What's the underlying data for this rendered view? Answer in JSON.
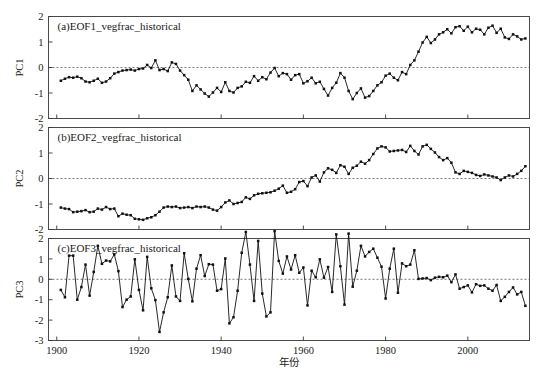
{
  "figure": {
    "background": "#ffffff",
    "line_color": "#111111",
    "frame_color": "#4a4a4a",
    "zero_line_color": "#555555",
    "xlabel": "年份",
    "x_ticks": [
      1900,
      1920,
      1940,
      1960,
      1980,
      2000
    ],
    "x_range": [
      1898,
      2015
    ]
  },
  "chart_data": [
    {
      "type": "line",
      "title": "(a)EOF1_vegfrac_historical",
      "ylabel": "PC1",
      "xlabel": "",
      "ylim": [
        -2,
        2
      ],
      "y_ticks": [
        -2,
        -1,
        0,
        1,
        2
      ],
      "grid": false,
      "legend": "none",
      "zero_reference": 0,
      "x": [
        1901,
        1902,
        1903,
        1904,
        1905,
        1906,
        1907,
        1908,
        1909,
        1910,
        1911,
        1912,
        1913,
        1914,
        1915,
        1916,
        1917,
        1918,
        1919,
        1920,
        1921,
        1922,
        1923,
        1924,
        1925,
        1926,
        1927,
        1928,
        1929,
        1930,
        1931,
        1932,
        1933,
        1934,
        1935,
        1936,
        1937,
        1938,
        1939,
        1940,
        1941,
        1942,
        1943,
        1944,
        1945,
        1946,
        1947,
        1948,
        1949,
        1950,
        1951,
        1952,
        1953,
        1954,
        1955,
        1956,
        1957,
        1958,
        1959,
        1960,
        1961,
        1962,
        1963,
        1964,
        1965,
        1966,
        1967,
        1968,
        1969,
        1970,
        1971,
        1972,
        1973,
        1974,
        1975,
        1976,
        1977,
        1978,
        1979,
        1980,
        1981,
        1982,
        1983,
        1984,
        1985,
        1986,
        1987,
        1988,
        1989,
        1990,
        1991,
        1992,
        1993,
        1994,
        1995,
        1996,
        1997,
        1998,
        1999,
        2000,
        2001,
        2002,
        2003,
        2004,
        2005,
        2006,
        2007,
        2008,
        2009,
        2010,
        2011,
        2012,
        2013,
        2014
      ],
      "values": [
        -0.52,
        -0.44,
        -0.38,
        -0.4,
        -0.36,
        -0.42,
        -0.55,
        -0.58,
        -0.52,
        -0.44,
        -0.6,
        -0.55,
        -0.42,
        -0.24,
        -0.18,
        -0.12,
        -0.1,
        -0.08,
        -0.12,
        -0.06,
        -0.04,
        0.1,
        -0.02,
        0.28,
        -0.1,
        -0.06,
        -0.14,
        0.2,
        0.14,
        -0.12,
        -0.3,
        -0.48,
        -0.92,
        -0.7,
        -0.86,
        -1.02,
        -1.14,
        -0.98,
        -0.8,
        -0.96,
        -0.58,
        -0.92,
        -0.98,
        -0.8,
        -0.74,
        -0.56,
        -0.6,
        -0.34,
        -0.52,
        -0.38,
        -0.46,
        -0.2,
        -0.02,
        -0.34,
        -0.22,
        -0.26,
        -0.48,
        -0.3,
        -0.26,
        -0.62,
        -0.54,
        -0.4,
        -0.62,
        -0.56,
        -0.84,
        -1.1,
        -0.8,
        -0.6,
        -0.22,
        -0.4,
        -0.92,
        -1.24,
        -1.0,
        -0.82,
        -1.18,
        -1.12,
        -0.92,
        -0.7,
        -0.58,
        -0.32,
        -0.24,
        -0.4,
        -0.5,
        -0.18,
        -0.26,
        0.1,
        0.28,
        0.62,
        0.98,
        1.2,
        0.96,
        1.1,
        1.3,
        1.38,
        1.5,
        1.34,
        1.58,
        1.62,
        1.44,
        1.6,
        1.38,
        1.52,
        1.48,
        1.3,
        1.56,
        1.64,
        1.36,
        1.52,
        1.18,
        1.12,
        1.3,
        1.22,
        1.1,
        1.14
      ]
    },
    {
      "type": "line",
      "title": "(b)EOF2_vegfrac_historical",
      "ylabel": "PC2",
      "xlabel": "",
      "ylim": [
        -2,
        2
      ],
      "y_ticks": [
        -2,
        -1,
        0,
        1,
        2
      ],
      "grid": false,
      "legend": "none",
      "zero_reference": 0,
      "x": [
        1901,
        1902,
        1903,
        1904,
        1905,
        1906,
        1907,
        1908,
        1909,
        1910,
        1911,
        1912,
        1913,
        1914,
        1915,
        1916,
        1917,
        1918,
        1919,
        1920,
        1921,
        1922,
        1923,
        1924,
        1925,
        1926,
        1927,
        1928,
        1929,
        1930,
        1931,
        1932,
        1933,
        1934,
        1935,
        1936,
        1937,
        1938,
        1939,
        1940,
        1941,
        1942,
        1943,
        1944,
        1945,
        1946,
        1947,
        1948,
        1949,
        1950,
        1951,
        1952,
        1953,
        1954,
        1955,
        1956,
        1957,
        1958,
        1959,
        1960,
        1961,
        1962,
        1963,
        1964,
        1965,
        1966,
        1967,
        1968,
        1969,
        1970,
        1971,
        1972,
        1973,
        1974,
        1975,
        1976,
        1977,
        1978,
        1979,
        1980,
        1981,
        1982,
        1983,
        1984,
        1985,
        1986,
        1987,
        1988,
        1989,
        1990,
        1991,
        1992,
        1993,
        1994,
        1995,
        1996,
        1997,
        1998,
        1999,
        2000,
        2001,
        2002,
        2003,
        2004,
        2005,
        2006,
        2007,
        2008,
        2009,
        2010,
        2011,
        2012,
        2013,
        2014
      ],
      "values": [
        -1.14,
        -1.18,
        -1.2,
        -1.32,
        -1.3,
        -1.28,
        -1.24,
        -1.32,
        -1.3,
        -1.18,
        -1.22,
        -1.12,
        -1.2,
        -1.18,
        -1.48,
        -1.38,
        -1.42,
        -1.44,
        -1.58,
        -1.6,
        -1.62,
        -1.56,
        -1.52,
        -1.44,
        -1.3,
        -1.14,
        -1.1,
        -1.12,
        -1.1,
        -1.16,
        -1.14,
        -1.12,
        -1.16,
        -1.1,
        -1.12,
        -1.1,
        -1.14,
        -1.22,
        -1.26,
        -1.12,
        -0.94,
        -0.86,
        -1.0,
        -0.96,
        -0.92,
        -0.74,
        -0.8,
        -0.66,
        -0.6,
        -0.58,
        -0.56,
        -0.54,
        -0.48,
        -0.4,
        -0.28,
        -0.56,
        -0.52,
        -0.42,
        -0.14,
        -0.1,
        -0.3,
        0.04,
        0.12,
        -0.12,
        0.24,
        0.4,
        0.34,
        0.22,
        0.52,
        0.46,
        0.18,
        0.42,
        0.5,
        0.66,
        0.58,
        0.72,
        0.96,
        1.18,
        1.26,
        1.22,
        1.06,
        1.08,
        1.1,
        1.12,
        1.04,
        1.28,
        1.08,
        0.94,
        1.26,
        1.32,
        1.16,
        1.02,
        0.84,
        0.72,
        0.8,
        0.62,
        0.24,
        0.18,
        0.3,
        0.26,
        0.22,
        0.14,
        0.1,
        0.16,
        0.12,
        0.08,
        0.04,
        -0.06,
        0.04,
        0.12,
        0.08,
        0.18,
        0.3,
        0.48,
        0.34,
        0.26,
        0.36,
        0.4,
        0.52
      ]
    },
    {
      "type": "line",
      "title": "(c)EOF3_vegfrac_historical",
      "ylabel": "PC3",
      "xlabel": "年份",
      "ylim": [
        -3,
        2
      ],
      "y_ticks": [
        -3,
        -2,
        -1,
        0,
        1,
        2
      ],
      "grid": false,
      "legend": "none",
      "zero_reference": 0,
      "x": [
        1901,
        1902,
        1903,
        1904,
        1905,
        1906,
        1907,
        1908,
        1909,
        1910,
        1911,
        1912,
        1913,
        1914,
        1915,
        1916,
        1917,
        1918,
        1919,
        1920,
        1921,
        1922,
        1923,
        1924,
        1925,
        1926,
        1927,
        1928,
        1929,
        1930,
        1931,
        1932,
        1933,
        1934,
        1935,
        1936,
        1937,
        1938,
        1939,
        1940,
        1941,
        1942,
        1943,
        1944,
        1945,
        1946,
        1947,
        1948,
        1949,
        1950,
        1951,
        1952,
        1953,
        1954,
        1955,
        1956,
        1957,
        1958,
        1959,
        1960,
        1961,
        1962,
        1963,
        1964,
        1965,
        1966,
        1967,
        1968,
        1969,
        1970,
        1971,
        1972,
        1973,
        1974,
        1975,
        1976,
        1977,
        1978,
        1979,
        1980,
        1981,
        1982,
        1983,
        1984,
        1985,
        1986,
        1987,
        1988,
        1989,
        1990,
        1991,
        1992,
        1993,
        1994,
        1995,
        1996,
        1997,
        1998,
        1999,
        2000,
        2001,
        2002,
        2003,
        2004,
        2005,
        2006,
        2007,
        2008,
        2009,
        2010,
        2011,
        2012,
        2013,
        2014
      ],
      "values": [
        -0.52,
        -0.88,
        1.16,
        1.16,
        -1.0,
        -0.38,
        0.72,
        -0.8,
        0.36,
        1.64,
        0.76,
        0.92,
        0.88,
        1.22,
        0.4,
        -1.36,
        -1.0,
        -0.84,
        0.98,
        -0.52,
        -1.52,
        1.1,
        -0.44,
        -1.02,
        -2.58,
        -1.62,
        -0.88,
        0.68,
        -0.84,
        -1.06,
        1.28,
        0.02,
        -1.08,
        0.52,
        1.18,
        0.16,
        0.74,
        0.72,
        -0.56,
        -0.48,
        1.02,
        -2.16,
        -1.86,
        -0.56,
        1.3,
        2.32,
        0.72,
        -1.06,
        1.88,
        -0.7,
        -1.82,
        -1.62,
        2.36,
        0.9,
        0.28,
        1.12,
        0.48,
        1.18,
        0.32,
        0.58,
        -1.28,
        0.42,
        0.1,
        0.98,
        0.08,
        0.6,
        -0.62,
        2.2,
        0.64,
        -1.24,
        2.24,
        -0.36,
        0.42,
        1.64,
        1.12,
        1.34,
        1.5,
        1.06,
        0.62,
        -0.94,
        0.52,
        1.5,
        -0.66,
        0.78,
        0.64,
        0.72,
        1.42,
        0.02,
        0.04,
        0.06,
        -0.04,
        0.08,
        0.12,
        0.1,
        0.18,
        -0.14,
        0.24,
        -0.46,
        -0.38,
        -0.3,
        -0.64,
        -0.24,
        -0.32,
        -0.3,
        -0.46,
        -0.56,
        -0.28,
        -1.06,
        -0.86,
        -0.62,
        -0.4,
        -0.74,
        -0.62,
        -1.3
      ]
    }
  ]
}
